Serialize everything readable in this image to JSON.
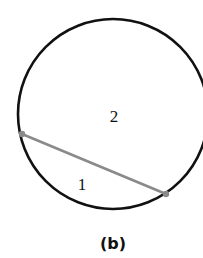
{
  "figure": {
    "caption": "(b)",
    "circle": {
      "cx": 113,
      "cy": 114,
      "r": 95,
      "stroke": "#111111",
      "stroke_width": 2.6
    },
    "chord": {
      "x1": 22,
      "y1": 134,
      "x2": 166,
      "y2": 194,
      "stroke": "#8a8a8a",
      "stroke_width": 2.6
    },
    "endpoints": [
      {
        "x": 22,
        "y": 134
      },
      {
        "x": 166,
        "y": 194
      }
    ],
    "regions": [
      {
        "label": "2",
        "x": 114,
        "y": 122
      },
      {
        "label": "1",
        "x": 82,
        "y": 190
      }
    ]
  }
}
